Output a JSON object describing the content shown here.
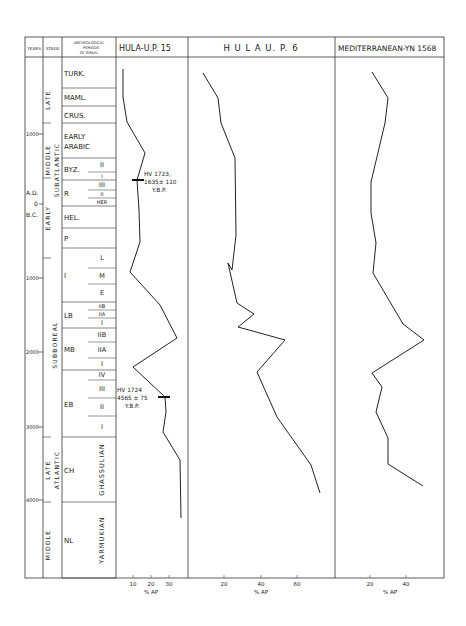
{
  "header": {
    "years": "YEARS",
    "stage": "STAGE",
    "archeo_line1": "ARCHEOLOGICAL",
    "archeo_line2": "PERIODS",
    "archeo_line3": "OF ISRAEL",
    "panel1_title": "HULA-U.P. 15",
    "panel2_title": "H U L A   U. P. 6",
    "panel3_title": "MEDITERRANEAN-YN 1568"
  },
  "years_axis": [
    {
      "label": "1000",
      "y": 134
    },
    {
      "label": "A.D.",
      "y": 193
    },
    {
      "label": "0",
      "y": 204
    },
    {
      "label": "B.C.",
      "y": 215
    },
    {
      "label": "1000",
      "y": 278
    },
    {
      "label": "2000",
      "y": 352
    },
    {
      "label": "3000",
      "y": 427
    },
    {
      "label": "4000",
      "y": 500
    }
  ],
  "stages": [
    {
      "label": "LATE",
      "sub": "SUBATLANTIC",
      "x": 48,
      "y0": 57,
      "y1": 123
    },
    {
      "label": "MIDDLE",
      "sub": "",
      "x": 48,
      "y0": 123,
      "y1": 178
    },
    {
      "label": "EARLY",
      "sub": "",
      "x": 48,
      "y0": 178,
      "y1": 258
    },
    {
      "label": "SUBATLANTIC",
      "x": 57,
      "y0": 100,
      "y1": 230
    },
    {
      "label": "SUBBOREAL",
      "x": 55,
      "y0": 258,
      "y1": 430
    },
    {
      "label": "LATE",
      "x": 48,
      "y0": 430,
      "y1": 500
    },
    {
      "label": "MIDDLE",
      "x": 48,
      "y0": 500,
      "y1": 578
    },
    {
      "label": "ATLANTIC",
      "x": 57,
      "y0": 440,
      "y1": 560
    }
  ],
  "periods": [
    {
      "label": "TURK.",
      "y0": 57,
      "y1": 88
    },
    {
      "label": "MAML.",
      "y0": 88,
      "y1": 106
    },
    {
      "label": "CRUS.",
      "y0": 106,
      "y1": 123
    },
    {
      "label": "EARLY",
      "label2": "ARABIC",
      "y0": 123,
      "y1": 158
    },
    {
      "label": "BYZ.",
      "y0": 158,
      "y1": 180,
      "subs": [
        {
          "label": "II",
          "y0": 158,
          "y1": 172
        },
        {
          "label": "I",
          "y0": 172,
          "y1": 180
        }
      ]
    },
    {
      "label": "R",
      "y0": 180,
      "y1": 206,
      "subs": [
        {
          "label": "III",
          "y0": 180,
          "y1": 190
        },
        {
          "label": "II",
          "y0": 190,
          "y1": 198
        },
        {
          "label": "HER",
          "y0": 198,
          "y1": 206
        }
      ]
    },
    {
      "label": "HEL.",
      "y0": 206,
      "y1": 228
    },
    {
      "label": "P",
      "y0": 228,
      "y1": 248
    },
    {
      "label": "I",
      "y0": 248,
      "y1": 302,
      "subs": [
        {
          "label": "L",
          "y0": 248,
          "y1": 268
        },
        {
          "label": "M",
          "y0": 268,
          "y1": 284
        },
        {
          "label": "E",
          "y0": 284,
          "y1": 302
        }
      ]
    },
    {
      "label": "LB",
      "y0": 302,
      "y1": 328,
      "subs": [
        {
          "label": "IIB",
          "y0": 302,
          "y1": 310
        },
        {
          "label": "IIA",
          "y0": 310,
          "y1": 318
        },
        {
          "label": "I",
          "y0": 318,
          "y1": 328
        }
      ]
    },
    {
      "label": "MB",
      "y0": 328,
      "y1": 370,
      "subs": [
        {
          "label": "IIB",
          "y0": 328,
          "y1": 342
        },
        {
          "label": "IIA",
          "y0": 342,
          "y1": 358
        },
        {
          "label": "I",
          "y0": 358,
          "y1": 370
        }
      ]
    },
    {
      "label": "EB",
      "y0": 370,
      "y1": 437,
      "subs": [
        {
          "label": "IV",
          "y0": 370,
          "y1": 380
        },
        {
          "label": "III",
          "y0": 380,
          "y1": 398
        },
        {
          "label": "II",
          "y0": 398,
          "y1": 416
        },
        {
          "label": "I",
          "y0": 416,
          "y1": 437
        }
      ]
    },
    {
      "label": "CH",
      "sub_vertical": "GHASSULIAN",
      "y0": 437,
      "y1": 502
    },
    {
      "label": "NL",
      "sub_vertical": "YARMUKIAN",
      "y0": 502,
      "y1": 578
    }
  ],
  "annotations": [
    {
      "panel": 1,
      "lines": [
        "HV 1723,",
        "1635± 110",
        "Y.B.P."
      ],
      "mark_y": 180
    },
    {
      "panel": 1,
      "lines": [
        "HV 1724",
        "4565 ± 75",
        "Y.B.P."
      ],
      "mark_y": 397
    }
  ],
  "chart_data": [
    {
      "type": "line",
      "title": "HULA-U.P. 15",
      "xlabel": "% AP",
      "ylabel": "Years",
      "xticks": [
        10,
        20,
        30
      ],
      "x_orientation": "horizontal, y axis = time (top = present)",
      "points_px": [
        [
          123,
          69
        ],
        [
          123,
          97
        ],
        [
          127,
          122
        ],
        [
          145,
          153
        ],
        [
          137,
          180
        ],
        [
          139,
          210
        ],
        [
          140,
          242
        ],
        [
          130,
          272
        ],
        [
          160,
          305
        ],
        [
          177,
          338
        ],
        [
          133,
          367
        ],
        [
          165,
          397
        ],
        [
          166,
          412
        ],
        [
          163,
          432
        ],
        [
          180,
          460
        ],
        [
          181,
          518
        ]
      ],
      "approx_years_vs_percentAP": [
        {
          "year": "1900 AD",
          "pct": 12
        },
        {
          "year": "1500 AD",
          "pct": 12
        },
        {
          "year": "1150 AD",
          "pct": 14
        },
        {
          "year": "700 AD",
          "pct": 25
        },
        {
          "year": "300 AD",
          "pct": 21
        },
        {
          "year": "100 BC",
          "pct": 22
        },
        {
          "year": "500 BC",
          "pct": 22
        },
        {
          "year": "900 BC",
          "pct": 16
        },
        {
          "year": "1400 BC",
          "pct": 28
        },
        {
          "year": "1800 BC",
          "pct": 36
        },
        {
          "year": "2200 BC",
          "pct": 11
        },
        {
          "year": "2600 BC",
          "pct": 30
        },
        {
          "year": "2800 BC",
          "pct": 30
        },
        {
          "year": "3100 BC",
          "pct": 29
        },
        {
          "year": "3500 BC",
          "pct": 38
        },
        {
          "year": "4300 BC",
          "pct": 38
        }
      ]
    },
    {
      "type": "line",
      "title": "HULA U.P.6",
      "xlabel": "% AP",
      "xticks": [
        20,
        40,
        60
      ],
      "points_px": [
        [
          203,
          73
        ],
        [
          218,
          98
        ],
        [
          221,
          123
        ],
        [
          235,
          158
        ],
        [
          236,
          235
        ],
        [
          232,
          270
        ],
        [
          228,
          263
        ],
        [
          237,
          303
        ],
        [
          254,
          314
        ],
        [
          238,
          327
        ],
        [
          285,
          340
        ],
        [
          257,
          372
        ],
        [
          277,
          417
        ],
        [
          311,
          465
        ],
        [
          320,
          493
        ]
      ],
      "approx_years_vs_percentAP": [
        {
          "year": "1900 AD",
          "pct": 10
        },
        {
          "year": "1400 AD",
          "pct": 20
        },
        {
          "year": "1100 AD",
          "pct": 22
        },
        {
          "year": "600 AD",
          "pct": 31
        },
        {
          "year": "400 BC",
          "pct": 32
        },
        {
          "year": "900 BC",
          "pct": 29
        },
        {
          "year": "1300 BC",
          "pct": 33
        },
        {
          "year": "1500 BC",
          "pct": 38
        },
        {
          "year": "1700 BC",
          "pct": 27
        },
        {
          "year": "1850 BC",
          "pct": 60
        },
        {
          "year": "2300 BC",
          "pct": 41
        },
        {
          "year": "2900 BC",
          "pct": 55
        },
        {
          "year": "3600 BC",
          "pct": 77
        },
        {
          "year": "4000 BC",
          "pct": 83
        }
      ]
    },
    {
      "type": "line",
      "title": "MEDITERRANEAN-YN 1568",
      "xlabel": "% AP",
      "xticks": [
        20,
        40
      ],
      "points_px": [
        [
          372,
          72
        ],
        [
          388,
          98
        ],
        [
          385,
          123
        ],
        [
          371,
          182
        ],
        [
          371,
          213
        ],
        [
          376,
          243
        ],
        [
          373,
          273
        ],
        [
          403,
          324
        ],
        [
          424,
          340
        ],
        [
          372,
          373
        ],
        [
          382,
          387
        ],
        [
          376,
          412
        ],
        [
          388,
          438
        ],
        [
          388,
          464
        ],
        [
          423,
          486
        ]
      ],
      "approx_years_vs_percentAP": [
        {
          "year": "1900 AD",
          "pct": 25
        },
        {
          "year": "1400 AD",
          "pct": 33
        },
        {
          "year": "1100 AD",
          "pct": 32
        },
        {
          "year": "300 AD",
          "pct": 25
        },
        {
          "year": "100 BC",
          "pct": 25
        },
        {
          "year": "500 BC",
          "pct": 27
        },
        {
          "year": "900 BC",
          "pct": 26
        },
        {
          "year": "1600 BC",
          "pct": 41
        },
        {
          "year": "1850 BC",
          "pct": 51
        },
        {
          "year": "2300 BC",
          "pct": 25
        },
        {
          "year": "2500 BC",
          "pct": 30
        },
        {
          "year": "2800 BC",
          "pct": 27
        },
        {
          "year": "3200 BC",
          "pct": 33
        },
        {
          "year": "3500 BC",
          "pct": 33
        },
        {
          "year": "3800 BC",
          "pct": 50
        }
      ]
    }
  ],
  "x_axes": [
    {
      "panel": 1,
      "ticks": [
        {
          "label": "10",
          "x": 133
        },
        {
          "label": "20",
          "x": 151
        },
        {
          "label": "30",
          "x": 169
        }
      ],
      "label": "% AP",
      "label_x": 151
    },
    {
      "panel": 2,
      "ticks": [
        {
          "label": "20",
          "x": 224
        },
        {
          "label": "40",
          "x": 261
        },
        {
          "label": "60",
          "x": 297
        }
      ],
      "label": "% AP",
      "label_x": 261
    },
    {
      "panel": 3,
      "ticks": [
        {
          "label": "20",
          "x": 370
        },
        {
          "label": "40",
          "x": 406
        }
      ],
      "label": "% AP",
      "label_x": 390
    }
  ]
}
